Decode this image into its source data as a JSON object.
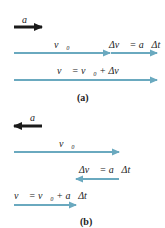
{
  "colors": {
    "velocity_arrow": "#6aa9bf",
    "acceleration_arrow": "#1a1a1a",
    "background": "#ffffff"
  },
  "panel_a": {
    "caption": "(a)",
    "acceleration_label": "a⃗",
    "acceleration_direction": "right",
    "v0_label": "v⃗₀",
    "delta_v_label": "Δv⃗ = a⃗Δt",
    "v_label": "v⃗ = v⃗₀ + Δv⃗"
  },
  "panel_b": {
    "caption": "(b)",
    "acceleration_label": "a⃗",
    "acceleration_direction": "left",
    "v0_label": "v⃗₀",
    "delta_v_label": "Δv⃗ = a⃗Δt",
    "v_label": "v⃗ = v⃗₀ + a⃗Δt"
  }
}
